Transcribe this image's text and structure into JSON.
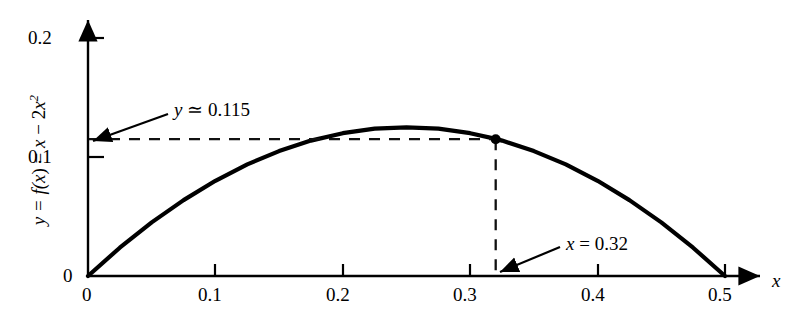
{
  "chart_data": {
    "type": "line",
    "title": "",
    "subtitle": "",
    "xlabel": "x",
    "ylabel": "y = f(x) = x − 2x²",
    "function": "y = x - 2x^2",
    "xlim": [
      0,
      0.52
    ],
    "ylim": [
      0,
      0.21
    ],
    "grid": false,
    "legend_position": "none",
    "x_ticks": [
      {
        "value": 0,
        "label": "0"
      },
      {
        "value": 0.1,
        "label": "0.1"
      },
      {
        "value": 0.2,
        "label": "0.2"
      },
      {
        "value": 0.3,
        "label": "0.3"
      },
      {
        "value": 0.4,
        "label": "0.4"
      },
      {
        "value": 0.5,
        "label": "0.5"
      }
    ],
    "y_ticks": [
      {
        "value": 0,
        "label": "0"
      },
      {
        "value": 0.1,
        "label": "0.1"
      },
      {
        "value": 0.2,
        "label": "0.2"
      }
    ],
    "series": [
      {
        "name": "y = x - 2x^2",
        "x": [
          0.0,
          0.025,
          0.05,
          0.075,
          0.1,
          0.125,
          0.15,
          0.175,
          0.2,
          0.225,
          0.25,
          0.275,
          0.3,
          0.32,
          0.325,
          0.35,
          0.375,
          0.4,
          0.425,
          0.45,
          0.475,
          0.5
        ],
        "values": [
          0.0,
          0.0238,
          0.045,
          0.0638,
          0.08,
          0.0938,
          0.105,
          0.1138,
          0.12,
          0.1238,
          0.125,
          0.1238,
          0.12,
          0.1152,
          0.1138,
          0.105,
          0.0938,
          0.08,
          0.0638,
          0.045,
          0.0238,
          0.0
        ]
      }
    ],
    "marked_point": {
      "x": 0.32,
      "y": 0.115,
      "x_label": "x = 0.32",
      "y_label": "y ≃ 0.115"
    },
    "annotations": [
      {
        "name": "y-value-annotation",
        "text_parts": {
          "var": "y",
          "rel": "≃",
          "value": "0.115"
        },
        "full_text": "y ≃ 0.115"
      },
      {
        "name": "x-value-annotation",
        "text_parts": {
          "var": "x",
          "rel": "=",
          "value": "0.32"
        },
        "full_text": "x = 0.32"
      }
    ],
    "colors": {
      "curve": "#000000",
      "axis": "#000000",
      "dashed": "#1a1a1a",
      "background": "#ffffff",
      "text": "#000000"
    }
  },
  "axis_labels": {
    "x_axis_name": "x",
    "y_axis_expression_prefix": "y = f(",
    "y_axis_expression_var": "x",
    "y_axis_expression_mid": ") = ",
    "y_axis_expression_x": "x",
    "y_axis_expression_minus": " − 2",
    "y_axis_expression_x2": "x",
    "y_axis_expression_exp": "2"
  },
  "x_tick_labels": [
    "0",
    "0.1",
    "0.2",
    "0.3",
    "0.4",
    "0.5"
  ],
  "y_tick_labels": [
    "0",
    "0.1",
    "0.2"
  ],
  "annotation_y": {
    "var": "y",
    "rel": "≃",
    "value": "0.115"
  },
  "annotation_x": {
    "var": "x",
    "rel": "=",
    "value": "0.32"
  }
}
